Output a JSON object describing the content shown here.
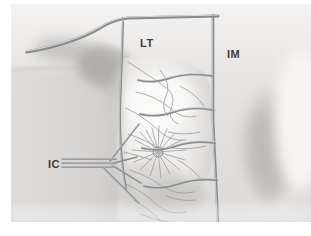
{
  "figure": {
    "background_color": "#ffffff",
    "canvas": {
      "width": 311,
      "height": 236
    },
    "content_area": {
      "x": 11,
      "y": 4,
      "width": 300,
      "height": 218
    },
    "vessel_line_color": "#8a8a8a",
    "vessel_highlight_color": "#d8d8d8",
    "duct_line_color": "#9b9b9b",
    "label_color": "#3c3c3c",
    "skin_tone_light": "#f1f0ee",
    "skin_tone_mid": "#dedcda",
    "skin_tone_shadow": "#b9b7b5"
  },
  "labels": [
    {
      "id": "lt",
      "text": "LT",
      "meaning": "lateral thoracic lymphatic pathway",
      "x": 140,
      "y": 47
    },
    {
      "id": "im",
      "text": "IM",
      "meaning": "internal mammary lymphatic pathway",
      "x": 227,
      "y": 58
    },
    {
      "id": "ic",
      "text": "IC",
      "meaning": "intercostal lymphatic pathway",
      "x": 48,
      "y": 163
    }
  ],
  "structures": [
    {
      "id": "top-vessel",
      "name": "superior horizontal lymphatic trunk"
    },
    {
      "id": "lt-vertical-vessel",
      "name": "lateral thoracic descending vessel"
    },
    {
      "id": "im-vertical-vessel",
      "name": "internal mammary descending vessel"
    },
    {
      "id": "ic-fan",
      "name": "intercostal branching vessels"
    },
    {
      "id": "nipple-areola",
      "name": "nipple areolar complex with radiating ducts"
    },
    {
      "id": "breast-contour",
      "name": "breast mound contour lines"
    },
    {
      "id": "chest-shadow",
      "name": "chest wall shading"
    },
    {
      "id": "contralateral-shadow",
      "name": "contralateral breast shading"
    }
  ]
}
